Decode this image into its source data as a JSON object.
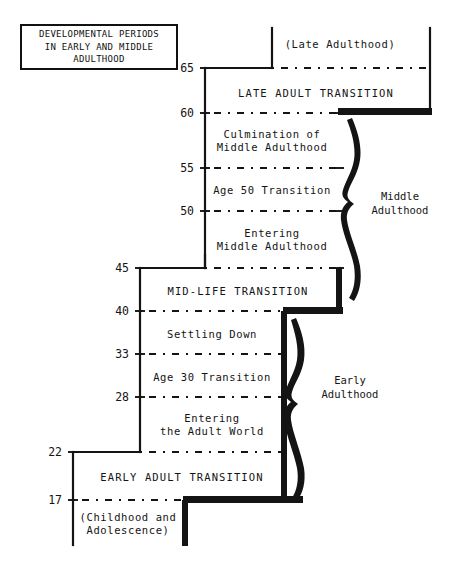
{
  "title_box": {
    "text": "DEVELOPMENTAL PERIODS\nIN EARLY AND MIDDLE\nADULTHOOD"
  },
  "axis": {
    "label": "age",
    "ticks": [
      {
        "value": "65",
        "y": 68
      },
      {
        "value": "60",
        "y": 113
      },
      {
        "value": "55",
        "y": 168
      },
      {
        "value": "50",
        "y": 211
      },
      {
        "value": "45",
        "y": 268
      },
      {
        "value": "40",
        "y": 311
      },
      {
        "value": "33",
        "y": 354
      },
      {
        "value": "28",
        "y": 397
      },
      {
        "value": "22",
        "y": 452
      },
      {
        "value": "17",
        "y": 500
      }
    ]
  },
  "periods": [
    {
      "id": "late-adulthood",
      "text": "(Late Adulthood)",
      "cx": 340,
      "cy": 44,
      "style": "mixed"
    },
    {
      "id": "late-adult-transition",
      "text": "LATE ADULT TRANSITION",
      "cx": 316,
      "cy": 93,
      "style": "caps"
    },
    {
      "id": "culmination-of-middle-adulthood",
      "text": "Culmination of\nMiddle Adulthood",
      "cx": 272,
      "cy": 141,
      "style": "mixed"
    },
    {
      "id": "age-50-transition",
      "text": "Age 50 Transition",
      "cx": 272,
      "cy": 190,
      "style": "mixed"
    },
    {
      "id": "entering-middle-adulthood",
      "text": "Entering\nMiddle Adulthood",
      "cx": 272,
      "cy": 240,
      "style": "mixed"
    },
    {
      "id": "mid-life-transition",
      "text": "MID-LIFE TRANSITION",
      "cx": 238,
      "cy": 291,
      "style": "caps"
    },
    {
      "id": "settling-down",
      "text": "Settling Down",
      "cx": 212,
      "cy": 334,
      "style": "mixed"
    },
    {
      "id": "age-30-transition",
      "text": "Age 30 Transition",
      "cx": 212,
      "cy": 377,
      "style": "mixed"
    },
    {
      "id": "entering-the-adult-world",
      "text": "Entering\nthe Adult World",
      "cx": 212,
      "cy": 425,
      "style": "mixed"
    },
    {
      "id": "early-adult-transition",
      "text": "EARLY ADULT TRANSITION",
      "cx": 182,
      "cy": 477,
      "style": "caps"
    },
    {
      "id": "childhood-and-adolescence",
      "text": "(Childhood and\nAdolescence)",
      "cx": 128,
      "cy": 524,
      "style": "mixed"
    }
  ],
  "eras": [
    {
      "id": "middle-adulthood",
      "text": "Middle\nAdulthood",
      "cx": 400,
      "cy": 203
    },
    {
      "id": "early-adulthood",
      "text": "Early\nAdulthood",
      "cx": 350,
      "cy": 387
    }
  ],
  "chart_data": {
    "type": "diagram",
    "title": "DEVELOPMENTAL PERIODS IN EARLY AND MIDDLE ADULTHOOD",
    "xlabel": "",
    "ylabel": "age",
    "axis_values": [
      17,
      22,
      28,
      33,
      40,
      45,
      50,
      55,
      60,
      65
    ],
    "eras": [
      {
        "name": "Early Adulthood",
        "age_start": 17,
        "age_end": 45
      },
      {
        "name": "Middle Adulthood",
        "age_start": 40,
        "age_end": 65
      }
    ],
    "periods": [
      {
        "name": "(Childhood and Adolescence)",
        "age_start": null,
        "age_end": 17,
        "kind": "era-context"
      },
      {
        "name": "EARLY ADULT TRANSITION",
        "age_start": 17,
        "age_end": 22,
        "kind": "transition"
      },
      {
        "name": "Entering the Adult World",
        "age_start": 22,
        "age_end": 28,
        "kind": "period"
      },
      {
        "name": "Age 30 Transition",
        "age_start": 28,
        "age_end": 33,
        "kind": "transition"
      },
      {
        "name": "Settling Down",
        "age_start": 33,
        "age_end": 40,
        "kind": "period"
      },
      {
        "name": "MID-LIFE TRANSITION",
        "age_start": 40,
        "age_end": 45,
        "kind": "transition"
      },
      {
        "name": "Entering Middle Adulthood",
        "age_start": 45,
        "age_end": 50,
        "kind": "period"
      },
      {
        "name": "Age 50 Transition",
        "age_start": 50,
        "age_end": 55,
        "kind": "transition"
      },
      {
        "name": "Culmination of Middle Adulthood",
        "age_start": 55,
        "age_end": 60,
        "kind": "period"
      },
      {
        "name": "LATE ADULT TRANSITION",
        "age_start": 60,
        "age_end": 65,
        "kind": "transition"
      },
      {
        "name": "(Late Adulthood)",
        "age_start": 65,
        "age_end": null,
        "kind": "era-context"
      }
    ]
  },
  "colors": {
    "ink": "#111111",
    "paper": "#ffffff"
  }
}
